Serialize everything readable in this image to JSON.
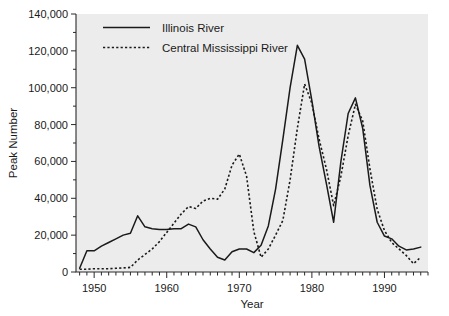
{
  "chart_data": {
    "type": "line",
    "title": "",
    "xlabel": "Year",
    "ylabel": "Peak Number",
    "xlim": [
      1947.5,
      1996
    ],
    "ylim": [
      0,
      140000
    ],
    "grid": false,
    "legend_position": "top-left-inside",
    "x_tick_labels": [
      "1950",
      "1960",
      "1970",
      "1980",
      "1990"
    ],
    "x_tick_values": [
      1950,
      1960,
      1970,
      1980,
      1990
    ],
    "x_minor_tick_interval": 1,
    "y_tick_labels": [
      "0",
      "20,000",
      "40,000",
      "60,000",
      "80,000",
      "100,000",
      "120,000",
      "140,000"
    ],
    "y_tick_values": [
      0,
      20000,
      40000,
      60000,
      80000,
      100000,
      120000,
      140000
    ],
    "y_minor_tick_interval": 10000,
    "series": [
      {
        "name": "Illinois River",
        "style": "solid",
        "color": "#1a1a1a",
        "x": [
          1948,
          1949,
          1950,
          1951,
          1952,
          1953,
          1954,
          1955,
          1956,
          1957,
          1958,
          1959,
          1960,
          1961,
          1962,
          1963,
          1964,
          1965,
          1966,
          1967,
          1968,
          1969,
          1970,
          1971,
          1972,
          1973,
          1974,
          1975,
          1976,
          1977,
          1978,
          1979,
          1980,
          1981,
          1982,
          1983,
          1984,
          1985,
          1986,
          1987,
          1988,
          1989,
          1990,
          1991,
          1992,
          1993,
          1994,
          1995
        ],
        "values": [
          2000,
          11500,
          11500,
          14000,
          16000,
          18000,
          20000,
          21000,
          30500,
          24500,
          23500,
          23000,
          23000,
          23500,
          23500,
          26000,
          24500,
          17500,
          12500,
          8000,
          6500,
          11000,
          12500,
          12500,
          10500,
          14500,
          25000,
          45000,
          72000,
          100000,
          123000,
          115500,
          93000,
          68000,
          48000,
          27000,
          60000,
          86000,
          94500,
          78000,
          47000,
          27000,
          19500,
          18000,
          14000,
          12000,
          12500,
          13500
        ]
      },
      {
        "name": "Central Mississippi River",
        "style": "dotted",
        "color": "#1a1a1a",
        "x": [
          1948,
          1949,
          1950,
          1951,
          1952,
          1953,
          1954,
          1955,
          1956,
          1957,
          1958,
          1959,
          1960,
          1961,
          1962,
          1963,
          1964,
          1965,
          1966,
          1967,
          1968,
          1969,
          1970,
          1971,
          1972,
          1973,
          1974,
          1975,
          1976,
          1977,
          1978,
          1979,
          1980,
          1981,
          1982,
          1983,
          1984,
          1985,
          1986,
          1987,
          1988,
          1989,
          1990,
          1991,
          1992,
          1993,
          1994,
          1995
        ],
        "values": [
          1500,
          1500,
          1800,
          1800,
          1800,
          2000,
          2200,
          2500,
          6500,
          9500,
          12500,
          16500,
          21500,
          26500,
          31500,
          35500,
          34500,
          38500,
          40000,
          39500,
          45000,
          58000,
          64000,
          52000,
          22000,
          8000,
          12500,
          20000,
          28000,
          50000,
          78000,
          102000,
          91500,
          72000,
          56000,
          36000,
          52000,
          74000,
          91000,
          82000,
          56000,
          34000,
          22500,
          16000,
          12500,
          9000,
          4500,
          8000
        ]
      }
    ]
  },
  "legend": {
    "entries": [
      {
        "label": "Illinois River",
        "style": "solid"
      },
      {
        "label": "Central Mississippi River",
        "style": "dotted"
      }
    ]
  },
  "axes": {
    "x_title": "Year",
    "y_title": "Peak Number"
  }
}
